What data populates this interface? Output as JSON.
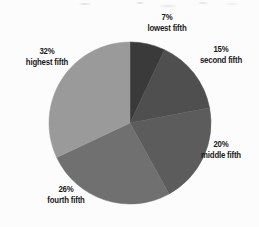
{
  "chart_data": {
    "type": "pie",
    "title": "",
    "subtitle": "",
    "xlabel": "",
    "ylabel": "",
    "legend_position": "none",
    "grid": false,
    "units": "percent",
    "start_angle_deg": 0,
    "direction": "clockwise",
    "categories": [
      "lowest fifth",
      "second fifth",
      "middle fifth",
      "fourth fifth",
      "highest fifth"
    ],
    "values": [
      7,
      15,
      20,
      26,
      32
    ],
    "slices": [
      {
        "name": "lowest fifth",
        "value": 7,
        "percent_label": "7%",
        "category_label": "lowest fifth",
        "color": "#3a3a3a",
        "start_deg": 0,
        "end_deg": 25.2
      },
      {
        "name": "second fifth",
        "value": 15,
        "percent_label": "15%",
        "category_label": "second fifth",
        "color": "#4f4f4f",
        "start_deg": 25.2,
        "end_deg": 79.2
      },
      {
        "name": "middle fifth",
        "value": 20,
        "percent_label": "20%",
        "category_label": "middle fifth",
        "color": "#5c5c5c",
        "start_deg": 79.2,
        "end_deg": 151.2
      },
      {
        "name": "fourth fifth",
        "value": 26,
        "percent_label": "26%",
        "category_label": "fourth fifth",
        "color": "#707070",
        "start_deg": 151.2,
        "end_deg": 244.8
      },
      {
        "name": "highest fifth",
        "value": 32,
        "percent_label": "32%",
        "category_label": "highest fifth",
        "color": "#9a9a9a",
        "start_deg": 244.8,
        "end_deg": 360
      }
    ]
  },
  "labels": {
    "lowest": {
      "percent": "7%",
      "category": "lowest fifth"
    },
    "second": {
      "percent": "15%",
      "category": "second fifth"
    },
    "middle": {
      "percent": "20%",
      "category": "middle fifth"
    },
    "fourth": {
      "percent": "26%",
      "category": "fourth fifth"
    },
    "highest": {
      "percent": "32%",
      "category": "highest fifth"
    }
  },
  "geometry": {
    "center_x": 130,
    "center_y": 123,
    "radius": 81
  },
  "colors": {
    "background": "#fcfcfc",
    "text": "#1a1a1a",
    "slice_lowest": "#3a3a3a",
    "slice_second": "#4f4f4f",
    "slice_middle": "#5c5c5c",
    "slice_fourth": "#707070",
    "slice_highest": "#9a9a9a"
  }
}
